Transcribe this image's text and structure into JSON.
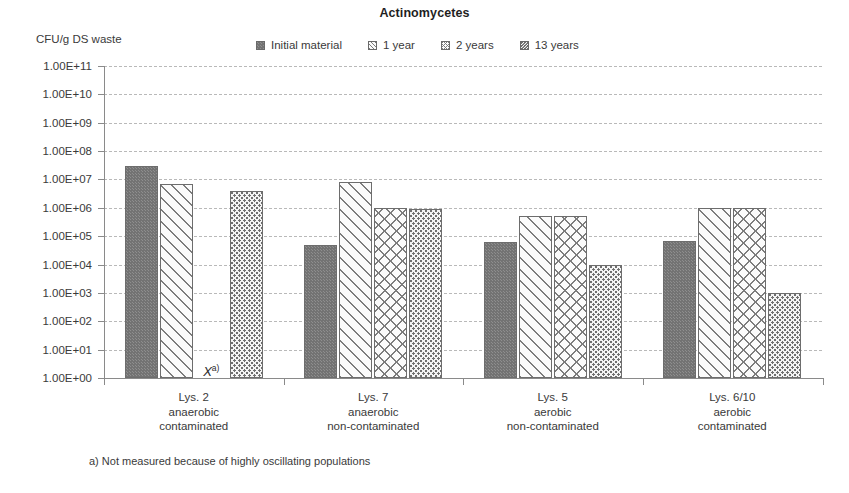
{
  "chart_data": {
    "type": "bar",
    "title": "Actinomycetes",
    "ylabel": "CFU/g DS waste",
    "xlabel": "",
    "yscale": "log",
    "ylim": [
      1,
      100000000000
    ],
    "grid": true,
    "legend_position": "top-center",
    "ytick_labels": [
      "1.00E+11",
      "1.00E+10",
      "1.00E+09",
      "1.00E+08",
      "1.00E+07",
      "1.00E+06",
      "1.00E+05",
      "1.00E+04",
      "1.00E+03",
      "1.00E+02",
      "1.00E+01",
      "1.00E+00"
    ],
    "ytick_values": [
      100000000000.0,
      10000000000.0,
      1000000000.0,
      100000000.0,
      10000000.0,
      1000000.0,
      100000.0,
      10000.0,
      1000.0,
      100.0,
      10.0,
      1.0
    ],
    "categories": [
      {
        "id": "lys2",
        "lines": [
          "Lys. 2",
          "anaerobic",
          "contaminated"
        ]
      },
      {
        "id": "lys7",
        "lines": [
          "Lys. 7",
          "anaerobic",
          "non-contaminated"
        ]
      },
      {
        "id": "lys5",
        "lines": [
          "Lys. 5",
          "aerobic",
          "non-contaminated"
        ]
      },
      {
        "id": "lys610",
        "lines": [
          "Lys. 6/10",
          "aerobic",
          "contaminated"
        ]
      }
    ],
    "series": [
      {
        "name": "Initial material",
        "pattern": "solid",
        "values": [
          30000000.0,
          50000.0,
          60000.0,
          70000.0
        ]
      },
      {
        "name": "1 year",
        "pattern": "diagonal",
        "values": [
          7000000.0,
          8000000.0,
          500000.0,
          1000000.0
        ]
      },
      {
        "name": "2 years",
        "pattern": "chevron",
        "values": [
          null,
          1000000.0,
          500000.0,
          1000000.0
        ]
      },
      {
        "name": "13 years",
        "pattern": "dots",
        "values": [
          4000000.0,
          900000.0,
          10000.0,
          1000.0
        ]
      }
    ],
    "annotations": [
      {
        "text": "X",
        "superscript": "a)",
        "category": "lys2",
        "series": "2 years",
        "meaning": "not-measured"
      }
    ],
    "footnote": "a) Not measured because of highly oscillating populations"
  }
}
